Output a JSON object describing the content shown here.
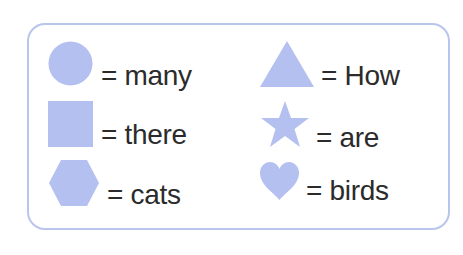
{
  "colors": {
    "shape_fill": "#b4c0f0",
    "border": "#bac5ee",
    "text": "#2b2b2b",
    "background": "#ffffff"
  },
  "legend": {
    "items": [
      {
        "shape": "circle",
        "icon": "circle-icon",
        "label": "= many"
      },
      {
        "shape": "square",
        "icon": "square-icon",
        "label": "= there"
      },
      {
        "shape": "hexagon",
        "icon": "hexagon-icon",
        "label": "= cats"
      },
      {
        "shape": "triangle",
        "icon": "triangle-icon",
        "label": "= How"
      },
      {
        "shape": "star",
        "icon": "star-icon",
        "label": "= are"
      },
      {
        "shape": "heart",
        "icon": "heart-icon",
        "label": "= birds"
      }
    ]
  }
}
